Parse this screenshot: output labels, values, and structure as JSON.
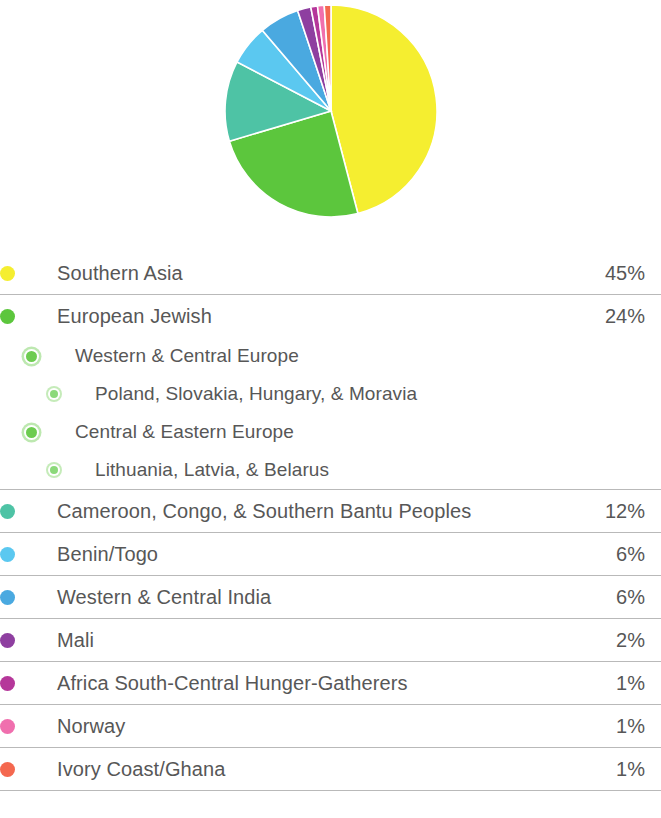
{
  "chart_data": {
    "type": "pie",
    "title": "",
    "start_angle_deg": 0,
    "direction": "clockwise",
    "legend_position": "below",
    "categories": [
      "Southern Asia",
      "European Jewish",
      "Cameroon, Congo, & Southern Bantu Peoples",
      "Benin/Togo",
      "Western & Central India",
      "Mali",
      "Africa South-Central Hunger-Gatherers",
      "Norway",
      "Ivory Coast/Ghana"
    ],
    "values": [
      45,
      24,
      12,
      6,
      6,
      2,
      1,
      1,
      1
    ],
    "value_labels": [
      "45%",
      "24%",
      "12%",
      "6%",
      "6%",
      "2%",
      "1%",
      "1%",
      "1%"
    ],
    "colors": [
      "#f5ee30",
      "#5cc63d",
      "#4ec3a5",
      "#5bc8f0",
      "#4aa9e0",
      "#8e3fa0",
      "#b5379a",
      "#f06fae",
      "#f4684f"
    ],
    "unit": "%"
  },
  "pie": {
    "slices": [
      {
        "name": "Southern Asia",
        "percent": 45,
        "color": "#f5ee30"
      },
      {
        "name": "European Jewish",
        "percent": 24,
        "color": "#5cc63d"
      },
      {
        "name": "Cameroon, Congo, & Southern Bantu Peoples",
        "percent": 12,
        "color": "#4ec3a5"
      },
      {
        "name": "Benin/Togo",
        "percent": 6,
        "color": "#5bc8f0"
      },
      {
        "name": "Western & Central India",
        "percent": 6,
        "color": "#4aa9e0"
      },
      {
        "name": "Mali",
        "percent": 2,
        "color": "#8e3fa0"
      },
      {
        "name": "Africa South-Central Hunger-Gatherers",
        "percent": 1,
        "color": "#b5379a"
      },
      {
        "name": "Norway",
        "percent": 1,
        "color": "#f06fae"
      },
      {
        "name": "Ivory Coast/Ghana",
        "percent": 1,
        "color": "#f4684f"
      }
    ]
  },
  "legend": {
    "groups": [
      {
        "rows": [
          {
            "level": 0,
            "label": "Southern Asia",
            "value": "45%",
            "color": "#f5ee30"
          }
        ]
      },
      {
        "rows": [
          {
            "level": 0,
            "label": "European Jewish",
            "value": "24%",
            "color": "#5cc63d"
          },
          {
            "level": 1,
            "label": "Western & Central Europe",
            "value": "",
            "color": "#6dcc50"
          },
          {
            "level": 2,
            "label": "Poland, Slovakia, Hungary, & Moravia",
            "value": "",
            "color": "#8bd97a"
          },
          {
            "level": 1,
            "label": "Central & Eastern Europe",
            "value": "",
            "color": "#6dcc50"
          },
          {
            "level": 2,
            "label": "Lithuania, Latvia, & Belarus",
            "value": "",
            "color": "#8bd97a"
          }
        ]
      },
      {
        "rows": [
          {
            "level": 0,
            "label": "Cameroon, Congo, & Southern Bantu Peoples",
            "value": "12%",
            "color": "#4ec3a5"
          }
        ]
      },
      {
        "rows": [
          {
            "level": 0,
            "label": "Benin/Togo",
            "value": "6%",
            "color": "#5bc8f0"
          }
        ]
      },
      {
        "rows": [
          {
            "level": 0,
            "label": "Western & Central India",
            "value": "6%",
            "color": "#4aa9e0"
          }
        ]
      },
      {
        "rows": [
          {
            "level": 0,
            "label": "Mali",
            "value": "2%",
            "color": "#8e3fa0"
          }
        ]
      },
      {
        "rows": [
          {
            "level": 0,
            "label": "Africa South-Central Hunger-Gatherers",
            "value": "1%",
            "color": "#b5379a"
          }
        ]
      },
      {
        "rows": [
          {
            "level": 0,
            "label": "Norway",
            "value": "1%",
            "color": "#f06fae"
          }
        ]
      },
      {
        "rows": [
          {
            "level": 0,
            "label": "Ivory Coast/Ghana",
            "value": "1%",
            "color": "#f4684f"
          }
        ]
      }
    ]
  }
}
